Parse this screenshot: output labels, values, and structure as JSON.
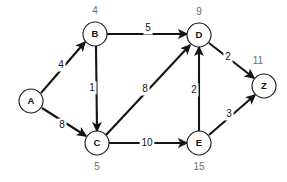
{
  "diagram": {
    "stroke_color": "#141414",
    "node_fill": "#ffffff",
    "distance_label_color": "#6e6e6e"
  },
  "nodes": [
    {
      "id": "A",
      "label": "A",
      "distance": "",
      "cx": 31,
      "cy": 101,
      "r": 12,
      "dist_x": 31,
      "dist_y": 101
    },
    {
      "id": "B",
      "label": "B",
      "distance": "4",
      "cx": 95,
      "cy": 34,
      "r": 12,
      "dist_x": 95,
      "dist_y": 11
    },
    {
      "id": "C",
      "label": "C",
      "distance": "5",
      "cx": 97,
      "cy": 143,
      "r": 12,
      "dist_x": 97,
      "dist_y": 167
    },
    {
      "id": "D",
      "label": "D",
      "distance": "9",
      "cx": 199,
      "cy": 35,
      "r": 12,
      "dist_x": 199,
      "dist_y": 12
    },
    {
      "id": "E",
      "label": "E",
      "distance": "15",
      "cx": 199,
      "cy": 143,
      "r": 12,
      "dist_x": 199,
      "dist_y": 167
    },
    {
      "id": "Z",
      "label": "Z",
      "distance": "11",
      "cx": 264,
      "cy": 86,
      "r": 12,
      "dist_x": 258,
      "dist_y": 61
    }
  ],
  "edges": [
    {
      "id": "A-B",
      "from": "A",
      "to": "B",
      "weight": "4",
      "x1": 41,
      "y1": 93,
      "x2": 85,
      "y2": 42,
      "lx": 61,
      "ly": 65
    },
    {
      "id": "A-C",
      "from": "A",
      "to": "C",
      "weight": "8",
      "x1": 42,
      "y1": 108,
      "x2": 86,
      "y2": 136,
      "lx": 62,
      "ly": 125
    },
    {
      "id": "B-D",
      "from": "B",
      "to": "D",
      "weight": "5",
      "x1": 107,
      "y1": 34,
      "x2": 187,
      "y2": 34,
      "lx": 148,
      "ly": 28
    },
    {
      "id": "B-C",
      "from": "B",
      "to": "C",
      "weight": "1",
      "x1": 96,
      "y1": 46,
      "x2": 97,
      "y2": 131,
      "lx": 92,
      "ly": 88
    },
    {
      "id": "C-D",
      "from": "C",
      "to": "D",
      "weight": "8",
      "x1": 106,
      "y1": 135,
      "x2": 190,
      "y2": 45,
      "lx": 145,
      "ly": 89
    },
    {
      "id": "C-E",
      "from": "C",
      "to": "E",
      "weight": "10",
      "x1": 109,
      "y1": 143,
      "x2": 187,
      "y2": 143,
      "lx": 147,
      "ly": 143
    },
    {
      "id": "E-D",
      "from": "E",
      "to": "D",
      "weight": "2",
      "x1": 199,
      "y1": 131,
      "x2": 199,
      "y2": 47,
      "lx": 194,
      "ly": 90
    },
    {
      "id": "D-Z",
      "from": "D",
      "to": "Z",
      "weight": "2",
      "x1": 209,
      "y1": 43,
      "x2": 254,
      "y2": 78,
      "lx": 228,
      "ly": 57
    },
    {
      "id": "E-Z",
      "from": "E",
      "to": "Z",
      "weight": "3",
      "x1": 209,
      "y1": 135,
      "x2": 255,
      "y2": 95,
      "lx": 229,
      "ly": 114
    }
  ]
}
